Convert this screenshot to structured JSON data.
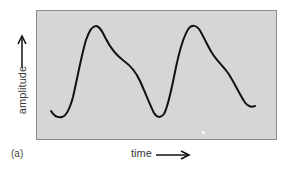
{
  "figure": {
    "panel_label": "(a)",
    "x_axis_label": "time",
    "y_axis_label": "amplitude",
    "x_arrow": "right-arrow",
    "y_arrow": "up-arrow",
    "colors": {
      "panel_fill": "#d6d6d6",
      "panel_border": "#8a8a8a",
      "curve": "#111111",
      "text": "#3a3a3a"
    }
  },
  "waveform": {
    "description": "Two cycles of an asymmetric periodic wave: steep rise to a rounded peak, then slower fall with a shoulder partway down",
    "path": "M51,111 C54,116 58,118 62,117 C67,116 70,108 73,97 C77,80 81,57 86,40 C89,31 92,26 96,26 C100,26 103,33 106,39 C110,47 116,55 124,61 C131,66 136,72 140,81 C145,92 150,105 154,113 C157,118 161,118 164,114 C168,107 171,92 175,72 C179,52 184,35 189,28 C192,25 196,25 199,29 C203,35 207,45 212,53 C217,61 223,66 228,73 C234,82 239,93 244,101 C247,106 250,108 255,106",
    "peaks": [
      {
        "x": 96,
        "y": 26
      },
      {
        "x": 193,
        "y": 26
      }
    ],
    "troughs": [
      {
        "x": 60,
        "y": 117
      },
      {
        "x": 158,
        "y": 117
      },
      {
        "x": 250,
        "y": 108
      }
    ]
  }
}
